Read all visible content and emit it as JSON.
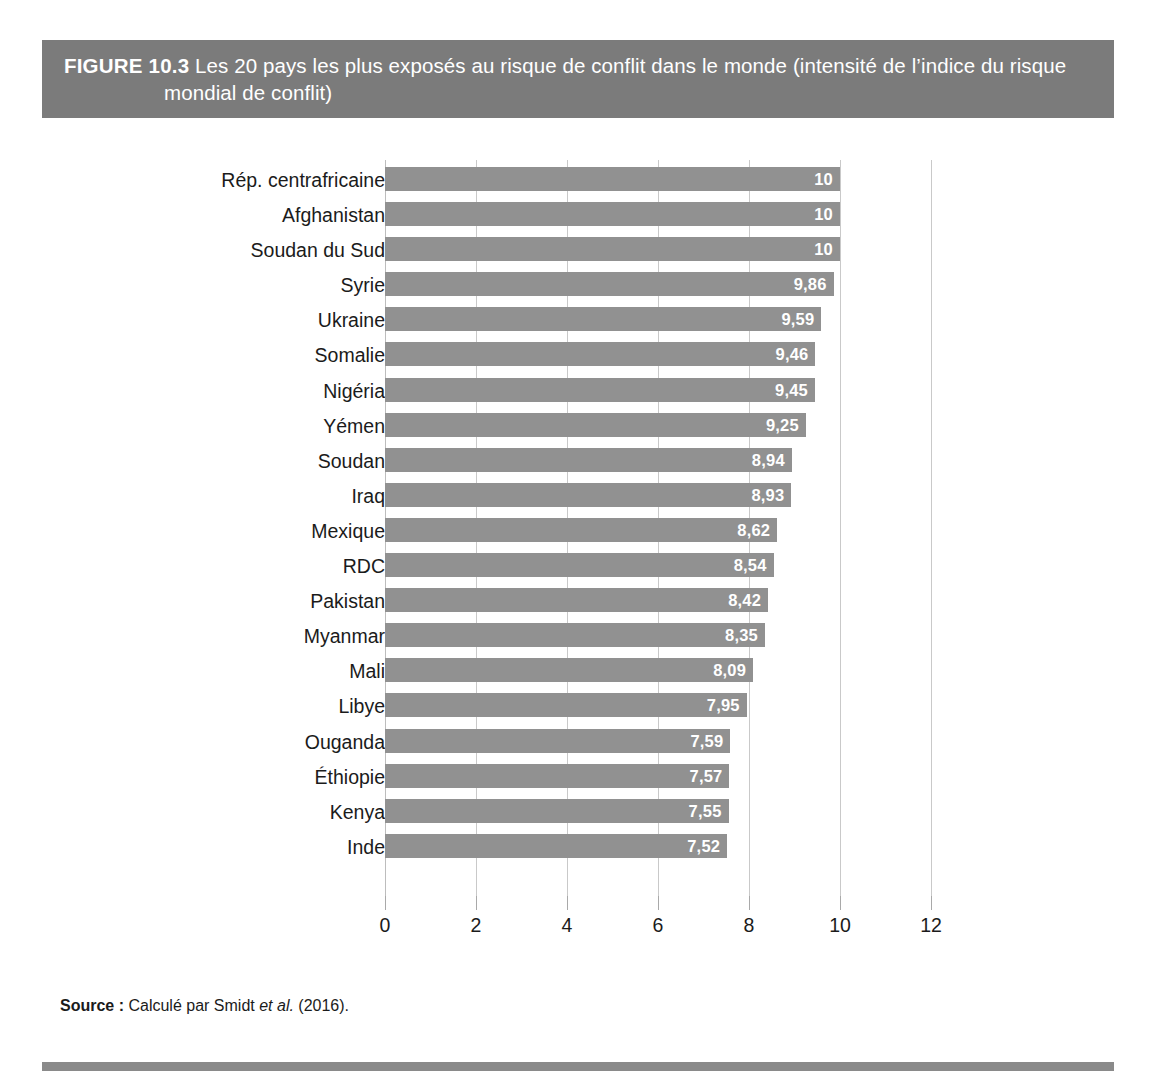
{
  "figure": {
    "label": "FIGURE 10.3",
    "title_line1": "Les 20 pays les plus exposés au risque de conflit dans le monde (intensité de l’indice du risque",
    "title_line2": "mondial de conflit)",
    "header_bg": "#7b7b7b",
    "bar_color": "#919191",
    "gridline_color": "#c9c9c9",
    "rule_color": "#8a8a8a"
  },
  "source": {
    "label": "Source :",
    "text_before": " Calculé par Smidt ",
    "etal": "et al.",
    "text_after": " (2016)."
  },
  "chart_data": {
    "type": "bar",
    "orientation": "horizontal",
    "xlabel": "",
    "ylabel": "",
    "xlim": [
      0,
      12
    ],
    "grid": true,
    "legend": null,
    "decimal_separator": ",",
    "xticks": [
      0,
      2,
      4,
      6,
      8,
      10,
      12
    ],
    "xticklabels": [
      "0",
      "2",
      "4",
      "6",
      "8",
      "10",
      "12"
    ],
    "categories": [
      "Rép. centrafricaine",
      "Afghanistan",
      "Soudan du Sud",
      "Syrie",
      "Ukraine",
      "Somalie",
      "Nigéria",
      "Yémen",
      "Soudan",
      "Iraq",
      "Mexique",
      "RDC",
      "Pakistan",
      "Myanmar",
      "Mali",
      "Libye",
      "Ouganda",
      "Éthiopie",
      "Kenya",
      "Inde"
    ],
    "values": [
      10,
      10,
      10,
      9.86,
      9.59,
      9.46,
      9.45,
      9.25,
      8.94,
      8.93,
      8.62,
      8.54,
      8.42,
      8.35,
      8.09,
      7.95,
      7.59,
      7.57,
      7.55,
      7.52
    ],
    "value_labels": [
      "10",
      "10",
      "10",
      "9,86",
      "9,59",
      "9,46",
      "9,45",
      "9,25",
      "8,94",
      "8,93",
      "8,62",
      "8,54",
      "8,42",
      "8,35",
      "8,09",
      "7,95",
      "7,59",
      "7,57",
      "7,55",
      "7,52"
    ]
  }
}
